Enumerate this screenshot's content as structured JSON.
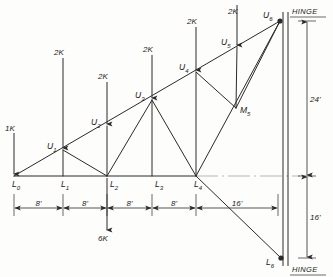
{
  "diagram": {
    "units": "feet and kips",
    "colors": {
      "line": "#2a2a2a",
      "light_line": "#9a9a9a",
      "background": "#fdfdfb",
      "text": "#1a1a1a"
    }
  },
  "nodes": [
    {
      "id": "L0",
      "base": "L",
      "sub": "0",
      "x": 14,
      "y": 176
    },
    {
      "id": "L1",
      "base": "L",
      "sub": "1",
      "x": 63,
      "y": 176
    },
    {
      "id": "L2",
      "base": "L",
      "sub": "2",
      "x": 107,
      "y": 176
    },
    {
      "id": "L3",
      "base": "L",
      "sub": "3",
      "x": 152,
      "y": 176
    },
    {
      "id": "L4",
      "base": "L",
      "sub": "4",
      "x": 196,
      "y": 176
    },
    {
      "id": "L6",
      "base": "L",
      "sub": "6",
      "x": 281,
      "y": 258
    },
    {
      "id": "U1",
      "base": "U",
      "sub": "1",
      "x": 63,
      "y": 150
    },
    {
      "id": "U2",
      "base": "U",
      "sub": "2",
      "x": 107,
      "y": 126
    },
    {
      "id": "U3",
      "base": "U",
      "sub": "3",
      "x": 152,
      "y": 100
    },
    {
      "id": "U4",
      "base": "U",
      "sub": "4",
      "x": 196,
      "y": 72
    },
    {
      "id": "U5",
      "base": "U",
      "sub": "5",
      "x": 237,
      "y": 47
    },
    {
      "id": "U6",
      "base": "U",
      "sub": "6",
      "x": 280,
      "y": 21
    },
    {
      "id": "M5",
      "base": "M",
      "sub": "5",
      "x": 236,
      "y": 108
    }
  ],
  "node_label_offsets": {
    "L0": {
      "dx": -2,
      "dy": 11
    },
    "L1": {
      "dx": -2,
      "dy": 11
    },
    "L2": {
      "dx": 3,
      "dy": 11
    },
    "L3": {
      "dx": 3,
      "dy": 11
    },
    "L4": {
      "dx": -2,
      "dy": 11
    },
    "L6": {
      "dx": -15,
      "dy": 7
    },
    "U1": {
      "dx": -16,
      "dy": -1
    },
    "U2": {
      "dx": -16,
      "dy": -1
    },
    "U3": {
      "dx": -17,
      "dy": -2
    },
    "U4": {
      "dx": -17,
      "dy": -2
    },
    "U5": {
      "dx": -16,
      "dy": -2
    },
    "U6": {
      "dx": -17,
      "dy": -3
    },
    "M5": {
      "dx": 4,
      "dy": 5
    }
  },
  "members": [
    {
      "name": "top-chord-L0-U6",
      "from": "L0",
      "to": "U6"
    },
    {
      "name": "bottom-chord-L0-L4",
      "from": "L0",
      "to": "L4"
    },
    {
      "name": "web-U1-L2",
      "from": "U1",
      "to": "L2"
    },
    {
      "name": "web-L2-U3",
      "from": "L2",
      "to": "U3"
    },
    {
      "name": "web-U3-L4",
      "from": "U3",
      "to": "L4"
    },
    {
      "name": "web-U4-M5",
      "from": "U4",
      "to": "M5"
    },
    {
      "name": "web-M5-U6",
      "from": "M5",
      "to": "U6"
    },
    {
      "name": "web-L4-U6",
      "from": "L4",
      "to": "U6"
    },
    {
      "name": "web-L4-L6",
      "from": "L4",
      "to": "L6"
    },
    {
      "name": "vertical-L1-U1",
      "from": "L1",
      "to": "U1"
    },
    {
      "name": "vertical-L2-U2",
      "from": "L2",
      "to": "U2"
    },
    {
      "name": "vertical-L3-U3",
      "from": "L3",
      "to": "U3"
    },
    {
      "name": "vertical-L4-U4",
      "from": "L4",
      "to": "U4"
    },
    {
      "name": "vertical-M5-U5",
      "from": "M5",
      "to": "U5"
    }
  ],
  "loads": [
    {
      "name": "load-L0",
      "label": "1K",
      "at": "L0",
      "x": 14,
      "top": 133,
      "tip": 174,
      "dir": "down",
      "label_x": 5,
      "label_y": 131
    },
    {
      "name": "load-U1",
      "label": "2K",
      "at": "U1",
      "x": 63,
      "top": 58,
      "tip": 148,
      "dir": "down",
      "label_x": 54,
      "label_y": 55
    },
    {
      "name": "load-U2",
      "label": "2K",
      "at": "U2",
      "x": 107,
      "top": 82,
      "tip": 124,
      "dir": "down",
      "label_x": 98,
      "label_y": 79
    },
    {
      "name": "load-U3",
      "label": "2K",
      "at": "U3",
      "x": 152,
      "top": 55,
      "tip": 98,
      "dir": "down",
      "label_x": 143,
      "label_y": 52
    },
    {
      "name": "load-U4",
      "label": "2K",
      "at": "U4",
      "x": 196,
      "top": 27,
      "tip": 70,
      "dir": "down",
      "label_x": 187,
      "label_y": 24
    },
    {
      "name": "load-U5",
      "label": "2K",
      "at": "U5",
      "x": 237,
      "top": 5,
      "tip": 45,
      "dir": "down",
      "label_x": 228,
      "label_y": 14
    },
    {
      "name": "load-L2",
      "label": "6K",
      "at": "L2",
      "x": 107,
      "top": 178,
      "tip": 230,
      "dir": "down",
      "label_x": 98,
      "label_y": 241
    }
  ],
  "dimensions": {
    "horizontal": {
      "name": "bay-dimension-line",
      "y": 208,
      "segments": [
        {
          "label": "8'",
          "from_x": 14,
          "to_x": 63
        },
        {
          "label": "8'",
          "from_x": 63,
          "to_x": 107
        },
        {
          "label": "8'",
          "from_x": 107,
          "to_x": 152
        },
        {
          "label": "8'",
          "from_x": 152,
          "to_x": 196
        },
        {
          "label": "16'",
          "from_x": 196,
          "to_x": 278
        }
      ]
    },
    "vertical": {
      "name": "height-dimension-line",
      "x": 307,
      "segments": [
        {
          "label": "24'",
          "from_y": 21,
          "to_y": 176
        },
        {
          "label": "16'",
          "from_y": 176,
          "to_y": 258
        }
      ]
    }
  },
  "column": {
    "name": "right-column",
    "x_left": 283,
    "x_right": 288,
    "top_y": 12,
    "bottom_y": 266
  },
  "hinges": [
    {
      "name": "hinge-top",
      "label": "HINGE",
      "x": 292,
      "y": 14
    },
    {
      "name": "hinge-bottom",
      "label": "HINGE",
      "x": 292,
      "y": 272
    }
  ],
  "centerline": {
    "name": "bottom-chord-centerline",
    "y": 176,
    "from_x": 196,
    "to_x": 300
  }
}
